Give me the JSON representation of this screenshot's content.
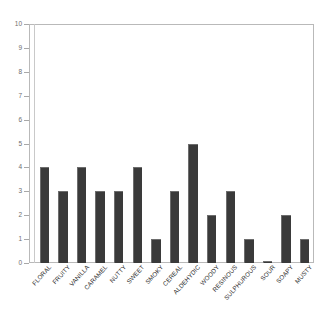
{
  "chart_data": {
    "type": "bar",
    "title": "",
    "subtitle": "",
    "xlabel": "",
    "ylabel": "",
    "ylim": [
      0,
      10
    ],
    "yticks": [
      0,
      1,
      2,
      3,
      4,
      5,
      6,
      7,
      8,
      9,
      10
    ],
    "ytick_labels": [
      "0",
      "1",
      "2",
      "3",
      "4",
      "5",
      "6",
      "7",
      "8",
      "9",
      "10"
    ],
    "grid": false,
    "legend": null,
    "legend_position": "none",
    "annotations": [],
    "bar_color": "#3a3a3a",
    "frame_color": "#b9b9b9",
    "categories": [
      "FLORAL",
      "FRUITY",
      "VANILLA",
      "CARAMEL",
      "NUTTY",
      "SWEET",
      "SMOKY",
      "CEREAL",
      "ALDEHYDIC",
      "WOODY",
      "RESINOUS",
      "SULPHUROUS",
      "SOUR",
      "SOAPY",
      "MUSTY"
    ],
    "values": [
      4,
      3,
      4,
      3,
      3,
      4,
      1,
      3,
      5,
      2,
      3,
      1,
      0.1,
      2,
      1
    ]
  }
}
